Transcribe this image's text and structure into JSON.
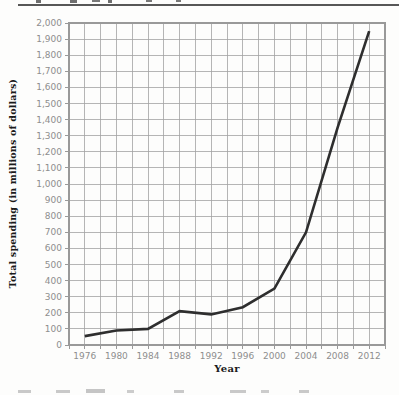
{
  "chart_data": {
    "type": "line",
    "title": "",
    "xlabel": "Year",
    "ylabel": "Total spending (in millions of dollars)",
    "categories": [
      1976,
      1980,
      1984,
      1988,
      1992,
      1996,
      2000,
      2004,
      2008,
      2012
    ],
    "values": [
      55,
      90,
      100,
      210,
      190,
      235,
      350,
      700,
      1350,
      1950
    ],
    "x_axis": {
      "min": 1974,
      "max": 2014,
      "grid_step": 2,
      "xtick_values": [
        1976,
        1980,
        1984,
        1988,
        1992,
        1996,
        2000,
        2004,
        2008,
        2012
      ],
      "xtick_labels": [
        "1976",
        "1980",
        "1984",
        "1988",
        "1992",
        "1996",
        "2000",
        "2004",
        "2008",
        "2012"
      ]
    },
    "y_axis": {
      "min": 0,
      "max": 2000,
      "grid_step": 100,
      "ytick_values": [
        0,
        100,
        200,
        300,
        400,
        500,
        600,
        700,
        800,
        900,
        1000,
        1100,
        1200,
        1300,
        1400,
        1500,
        1600,
        1700,
        1800,
        1900,
        2000
      ],
      "ytick_labels": [
        "0",
        "100",
        "200",
        "300",
        "400",
        "500",
        "600",
        "700",
        "800",
        "900",
        "1,000",
        "1,100",
        "1,200",
        "1,300",
        "1,400",
        "1,500",
        "1,600",
        "1,700",
        "1,800",
        "1,900",
        "2,000"
      ]
    },
    "grid": true,
    "legend": false,
    "colors": {
      "line": "#2e2e2e",
      "grid": "#a3a3a3",
      "frame": "#999999",
      "tick_label": "#8e8e8e",
      "axis_title": "#1b1b1b",
      "top_rule": "#575757"
    }
  }
}
